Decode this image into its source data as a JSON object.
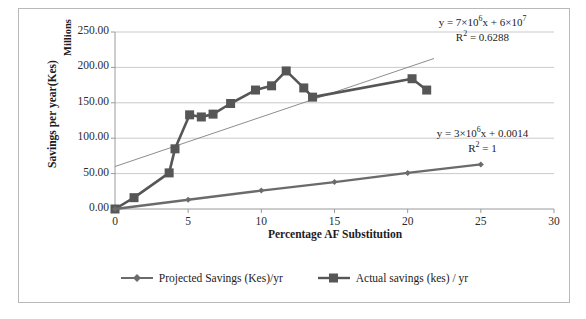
{
  "chart_data": {
    "type": "line",
    "title": "",
    "xlabel": "Percentage AF Substitution",
    "ylabel": "Savings per year(Kes)",
    "y_units_label": "Millions",
    "xlim": [
      0,
      30
    ],
    "ylim": [
      0,
      250
    ],
    "xticks": [
      0,
      5,
      10,
      15,
      20,
      25,
      30
    ],
    "xtick_labels": [
      "0",
      "5",
      "10",
      "15",
      "20",
      "25",
      "30"
    ],
    "yticks": [
      0,
      50,
      100,
      150,
      200,
      250
    ],
    "ytick_labels": [
      "0.00",
      "50.00",
      "100.00",
      "150.00",
      "200.00",
      "250.00"
    ],
    "grid": "horizontal",
    "legend_position": "bottom-center",
    "series": [
      {
        "name": "Projected Savings (Kes)/yr",
        "marker": "diamond",
        "color": "#6b6b6b",
        "points": [
          {
            "x": 0.0,
            "y": 0.0
          },
          {
            "x": 5.0,
            "y": 13.0
          },
          {
            "x": 10.0,
            "y": 26.0
          },
          {
            "x": 15.0,
            "y": 38.0
          },
          {
            "x": 20.0,
            "y": 51.0
          },
          {
            "x": 25.0,
            "y": 63.0
          }
        ]
      },
      {
        "name": "Actual savings (kes) / yr",
        "marker": "square",
        "color": "#565656",
        "points": [
          {
            "x": 0.0,
            "y": 0.0
          },
          {
            "x": 1.3,
            "y": 16.0
          },
          {
            "x": 3.7,
            "y": 51.0
          },
          {
            "x": 4.1,
            "y": 85.0
          },
          {
            "x": 5.1,
            "y": 133.0
          },
          {
            "x": 5.9,
            "y": 130.0
          },
          {
            "x": 6.7,
            "y": 134.0
          },
          {
            "x": 7.9,
            "y": 149.0
          },
          {
            "x": 9.6,
            "y": 168.0
          },
          {
            "x": 10.7,
            "y": 174.0
          },
          {
            "x": 11.7,
            "y": 195.0
          },
          {
            "x": 12.9,
            "y": 171.0
          },
          {
            "x": 13.5,
            "y": 158.0
          },
          {
            "x": 20.3,
            "y": 184.0
          },
          {
            "x": 21.3,
            "y": 168.0
          }
        ]
      }
    ],
    "trendlines": [
      {
        "for_series": "Actual savings (kes) / yr",
        "slope": 7000000,
        "intercept": 60000000,
        "x_start": 0.0,
        "x_end": 21.8,
        "equation": "y = 7×10⁶x + 6×10⁷",
        "r_squared_label": "R² = 0.6288",
        "r_squared": 0.6288
      },
      {
        "for_series": "Projected Savings (Kes)/yr",
        "slope": 3000000,
        "intercept": 0.0014,
        "x_start": 0.0,
        "x_end": 25.0,
        "equation": "y = 3×10⁶x + 0.0014",
        "r_squared_label": "R² = 1",
        "r_squared": 1
      }
    ],
    "annotations": [
      {
        "id": "trend-eq-actual",
        "equation_prefix": "y = 7×10",
        "equation_exp1": "6",
        "equation_mid": "x + 6×10",
        "equation_exp2": "7",
        "r_label": "R",
        "r_sup": "2",
        "r_value": " = 0.6288"
      },
      {
        "id": "trend-eq-projected",
        "equation_prefix": "y = 3×10",
        "equation_exp1": "6",
        "equation_mid": "x + 0.0014",
        "equation_exp2": "",
        "r_label": "R",
        "r_sup": "2",
        "r_value": " = 1"
      }
    ],
    "colors": {
      "series_actual": "#565656",
      "series_projected": "#6b6b6b",
      "trendline": "#808080",
      "grid": "#c4c4c4",
      "axis": "#9a9a9a",
      "border": "#b9b9b9",
      "text": "#1c1c1c"
    }
  }
}
